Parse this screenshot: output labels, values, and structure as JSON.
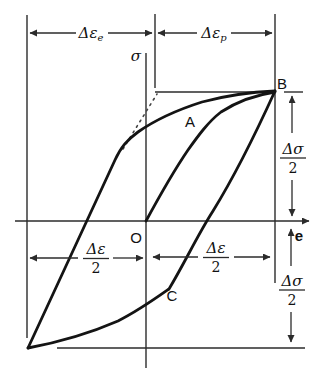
{
  "labels": {
    "sigma_axis": "σ",
    "strain_axis": "e",
    "origin": "O",
    "point_a": "A",
    "point_b": "B",
    "point_c": "C"
  },
  "dimensions": {
    "elastic_strain": {
      "base": "Δε",
      "sub": "e"
    },
    "plastic_strain": {
      "base": "Δε",
      "sub": "p"
    },
    "strain_amplitude_left": {
      "num": "Δε",
      "den": "2"
    },
    "strain_amplitude_right": {
      "num": "Δε",
      "den": "2"
    },
    "stress_amplitude_upper": {
      "num": "Δσ",
      "den": "2"
    },
    "stress_amplitude_lower": {
      "num": "Δσ",
      "den": "2"
    }
  },
  "colors": {
    "ink": "#141414",
    "background": "#ffffff"
  }
}
